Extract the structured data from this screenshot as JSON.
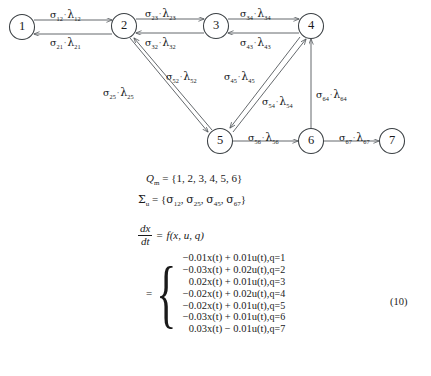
{
  "figure": {
    "type": "automaton-state-transition-diagram",
    "nodes": [
      {
        "id": "1",
        "label": "1",
        "cx": 22,
        "cy": 27
      },
      {
        "id": "2",
        "label": "2",
        "cx": 124,
        "cy": 26
      },
      {
        "id": "3",
        "label": "3",
        "cx": 216,
        "cy": 26
      },
      {
        "id": "4",
        "label": "4",
        "cx": 311,
        "cy": 26
      },
      {
        "id": "5",
        "label": "5",
        "cx": 220,
        "cy": 141
      },
      {
        "id": "6",
        "label": "6",
        "cx": 311,
        "cy": 141
      },
      {
        "id": "7",
        "label": "7",
        "cx": 392,
        "cy": 141
      }
    ],
    "edges": [
      {
        "from": "1",
        "to": "2",
        "sigma_sub": "12",
        "lambda_sub": "12",
        "label_x": 50,
        "label_y": 8
      },
      {
        "from": "2",
        "to": "1",
        "sigma_sub": "21",
        "lambda_sub": "21",
        "label_x": 50,
        "label_y": 36
      },
      {
        "from": "2",
        "to": "3",
        "sigma_sub": "23",
        "lambda_sub": "23",
        "label_x": 145,
        "label_y": 7
      },
      {
        "from": "3",
        "to": "2",
        "sigma_sub": "32",
        "lambda_sub": "32",
        "label_x": 145,
        "label_y": 36
      },
      {
        "from": "3",
        "to": "4",
        "sigma_sub": "34",
        "lambda_sub": "34",
        "label_x": 240,
        "label_y": 7
      },
      {
        "from": "4",
        "to": "3",
        "sigma_sub": "43",
        "lambda_sub": "43",
        "label_x": 240,
        "label_y": 36
      },
      {
        "from": "2",
        "to": "5",
        "sigma_sub": "25",
        "lambda_sub": "25",
        "label_x": 103,
        "label_y": 86
      },
      {
        "from": "5",
        "to": "2",
        "sigma_sub": "52",
        "lambda_sub": "52",
        "label_x": 166,
        "label_y": 70
      },
      {
        "from": "4",
        "to": "5",
        "sigma_sub": "45",
        "lambda_sub": "45",
        "label_x": 224,
        "label_y": 70
      },
      {
        "from": "5",
        "to": "4",
        "sigma_sub": "54",
        "lambda_sub": "54",
        "label_x": 262,
        "label_y": 95
      },
      {
        "from": "6",
        "to": "4",
        "sigma_sub": "64",
        "lambda_sub": "64",
        "label_x": 316,
        "label_y": 88
      },
      {
        "from": "5",
        "to": "6",
        "sigma_sub": "56",
        "lambda_sub": "56",
        "label_x": 248,
        "label_y": 131
      },
      {
        "from": "6",
        "to": "7",
        "sigma_sub": "67",
        "lambda_sub": "67",
        "label_x": 339,
        "label_y": 131
      }
    ]
  },
  "equations": {
    "qm": {
      "lhs": "Q",
      "lhs_sub": "m",
      "eq": "=",
      "set": "{1, 2, 3, 4, 5, 6}"
    },
    "sigma_u": {
      "lhs": "Σ",
      "lhs_sub": "u",
      "eq": "=",
      "open": "{",
      "members": [
        "12",
        "25",
        "45",
        "67"
      ],
      "close": "}"
    },
    "ode": {
      "frac_num": "dx",
      "frac_den": "dt",
      "eq": "=",
      "rhs": "f(x, u, q)"
    },
    "cases": {
      "eq_sign": "=",
      "rows": [
        {
          "expr": "−0.01x(t) + 0.01u(t),",
          "cond": "q=1"
        },
        {
          "expr": "−0.03x(t) + 0.02u(t),",
          "cond": "q=2"
        },
        {
          "expr": "0.02x(t) + 0.01u(t),",
          "cond": "q=3"
        },
        {
          "expr": "−0.02x(t) + 0.02u(t),",
          "cond": "q=4"
        },
        {
          "expr": "−0.02x(t) + 0.01u(t),",
          "cond": "q=5"
        },
        {
          "expr": "−0.03x(t) + 0.01u(t),",
          "cond": "q=6"
        },
        {
          "expr": "0.03x(t) − 0.01u(t),",
          "cond": "q=7"
        }
      ]
    },
    "equation_number": "(10)"
  },
  "style": {
    "line_color": "#53585c",
    "node_stroke": "#3b4044",
    "text_color": "#1a1a1a",
    "background": "#ffffff"
  }
}
